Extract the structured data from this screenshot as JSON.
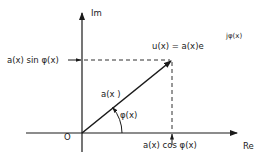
{
  "diagram": {
    "title": "",
    "axes": {
      "imaginary_label": "Im",
      "real_label": "Re",
      "origin_label": "O"
    },
    "vector": {
      "magnitude_label": "a(x )",
      "angle_label": "φ(x)"
    },
    "phasor_expression": {
      "base": "u(x) = a(x)e",
      "exponent": "jφ(x)"
    },
    "projections": {
      "imaginary_part": "a(x) sin φ(x)",
      "real_part": "a(x) cos φ(x)"
    },
    "colors": {
      "ink": "#1a1a1a",
      "background": "#ffffff"
    }
  }
}
